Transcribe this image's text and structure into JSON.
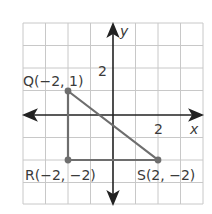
{
  "diagram": {
    "axes": {
      "x_label": "x",
      "y_label": "y",
      "x_tick": "2",
      "y_tick": "2"
    },
    "grid": {
      "xmin": -4,
      "xmax": 4,
      "ymin": -4,
      "ymax": 4,
      "step": 1
    },
    "points": [
      {
        "name": "Q",
        "x": -2,
        "y": 1,
        "label": "Q(−2, 1)"
      },
      {
        "name": "R",
        "x": -2,
        "y": -2,
        "label": "R(−2, −2)"
      },
      {
        "name": "S",
        "x": 2,
        "y": -2,
        "label": "S(2, −2)"
      }
    ],
    "colors": {
      "grid": "#c8c8c8",
      "axis": "#222222",
      "triangle": "#6e6e6e"
    }
  }
}
